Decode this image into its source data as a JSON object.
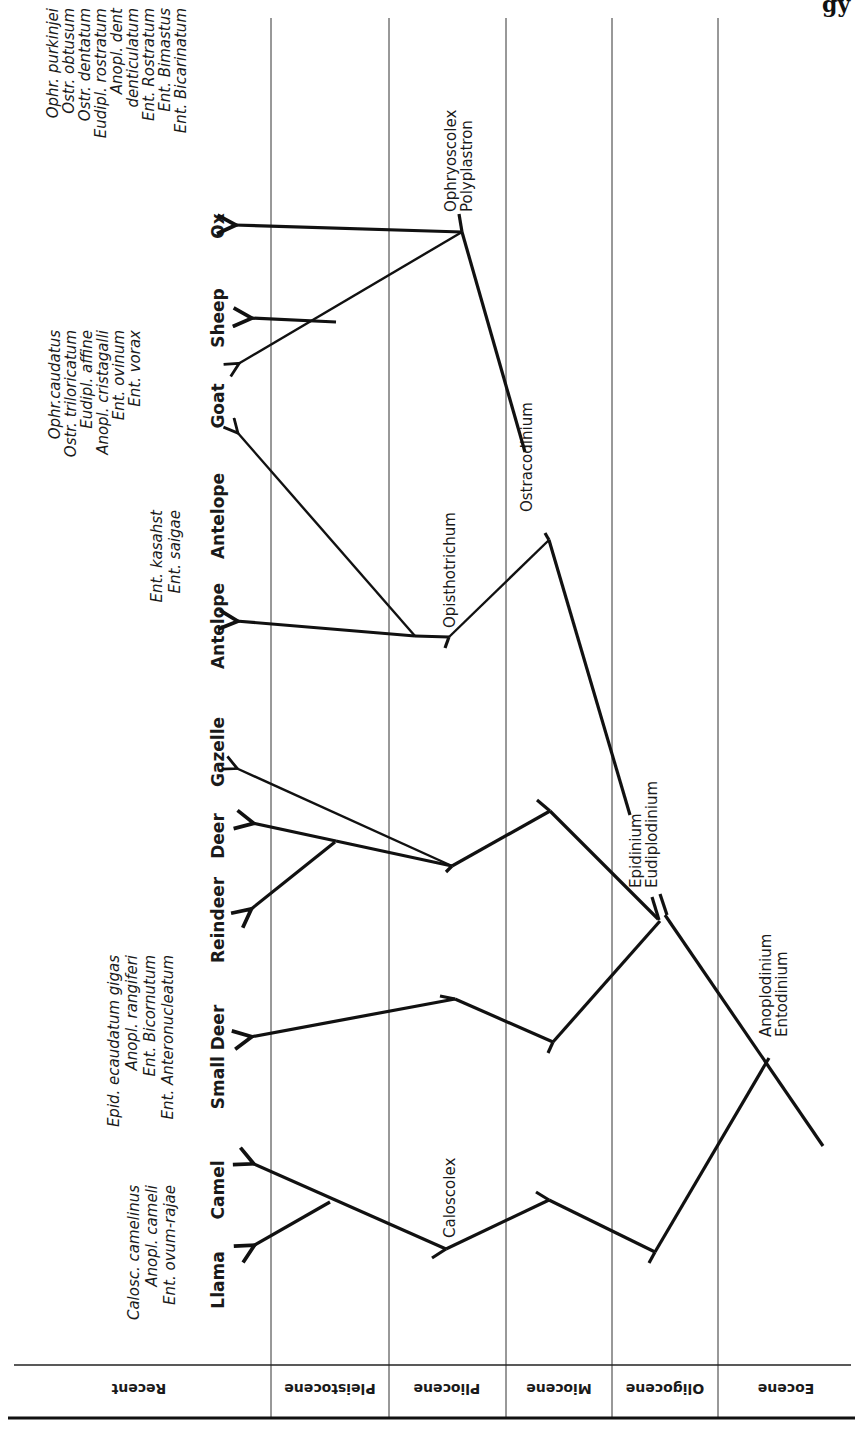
{
  "page": {
    "corner_text": "gy"
  },
  "epochs": [
    {
      "label": "Recent",
      "x_from": 8,
      "x_to": 271
    },
    {
      "label": "Pleistocene",
      "x_from": 271,
      "x_to": 389
    },
    {
      "label": "Pliocene",
      "x_from": 389,
      "x_to": 506
    },
    {
      "label": "Miocene",
      "x_from": 506,
      "x_to": 612
    },
    {
      "label": "Oligocene",
      "x_from": 612,
      "x_to": 718
    },
    {
      "label": "Eocene",
      "x_from": 718,
      "x_to": 855
    }
  ],
  "hosts": [
    {
      "label": "Ox",
      "x": 224,
      "y": 226
    },
    {
      "label": "Sheep",
      "x": 224,
      "y": 318
    },
    {
      "label": "Goat",
      "x": 224,
      "y": 406
    },
    {
      "label": "Antelope",
      "x": 224,
      "y": 516
    },
    {
      "label": "Antelope",
      "x": 224,
      "y": 626
    },
    {
      "label": "Gazelle",
      "x": 224,
      "y": 752
    },
    {
      "label": "Deer",
      "x": 224,
      "y": 836
    },
    {
      "label": "Reindeer",
      "x": 224,
      "y": 920
    },
    {
      "label": "Small Deer",
      "x": 224,
      "y": 1057
    },
    {
      "label": "Camel",
      "x": 224,
      "y": 1190
    },
    {
      "label": "Llama",
      "x": 224,
      "y": 1280
    }
  ],
  "species_groups": [
    {
      "host": "Ox",
      "x": 48,
      "y": 8,
      "lines": [
        "Ophr. purkinjei",
        "Ostr. obtusum",
        "Ostr. dentatum",
        "Eudipl. rostratum",
        "Anopl. dent",
        "    denticulatum",
        "Ent. Rostratum",
        "Ent. Bimastus",
        "Ent. Bicarinatum"
      ]
    },
    {
      "host": "Sheep, Goat",
      "x": 48,
      "y": 330,
      "lines": [
        "Ophr.caudatus",
        "Ostr. triloricatum",
        "Eudipl. affine",
        "Anopl. cristagalli",
        "Ent. ovinum",
        "Ent. vorax"
      ]
    },
    {
      "host": "Antelope",
      "x": 148,
      "y": 510,
      "lines": [
        "Ent. kasahst",
        "Ent. saigae"
      ]
    },
    {
      "host": "Reindeer, Deer",
      "x": 105,
      "y": 775,
      "lines": [
        "Epid. ecaudatum gigas",
        "Anopl. rangiferi",
        "Ent. Bicornutum",
        "Ent. Anteronucleatum"
      ]
    },
    {
      "host": "Camel, Llama",
      "x": 125,
      "y": 1018,
      "lines": [
        "Calosc. camelinus",
        "Anopl. cameli",
        "Ent. ovum-rajae"
      ]
    }
  ],
  "genera": [
    {
      "lines": [
        "Ophryoscolex",
        "Polyplastron"
      ],
      "x": 462,
      "y": 208
    },
    {
      "lines": [
        "Ostracodinium"
      ],
      "x": 524,
      "y": 450
    },
    {
      "lines": [
        "Opisthotrichum"
      ],
      "x": 445,
      "y": 628
    },
    {
      "lines": [
        "Epidinium",
        "Eudiplodinium"
      ],
      "x": 633,
      "y": 790
    },
    {
      "lines": [
        "Anoplodinium",
        "Entodinium"
      ],
      "x": 760,
      "y": 1018
    },
    {
      "lines": [
        "Caloscolex"
      ],
      "x": 445,
      "y": 1237
    }
  ]
}
